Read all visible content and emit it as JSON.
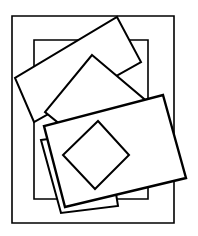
{
  "figure": {
    "canvas": {
      "width": 198,
      "height": 236
    },
    "colors": {
      "background": "#ffffff",
      "stroke": "#000000",
      "fill": "#ffffff"
    },
    "shape_count": 7,
    "shapes": [
      {
        "id": "outer-border-rectangle",
        "name": "outer-border-rectangle",
        "kind": "rectangle",
        "orientation": "axis-aligned",
        "stroke_weight": "thin",
        "z": 1,
        "points": "12,16 174,16 174,223 12,223"
      },
      {
        "id": "inner-upright-rectangle",
        "name": "inner-upright-rectangle",
        "kind": "rectangle",
        "orientation": "axis-aligned",
        "stroke_weight": "thin",
        "z": 2,
        "points": "34,40 148,40 148,199 34,199"
      },
      {
        "id": "upper-left-tilted-rectangle",
        "name": "upper-left-tilted-rectangle",
        "kind": "rectangle",
        "orientation": "rotated",
        "stroke_weight": "medium",
        "z": 3,
        "points": "117,17 141,62 34,122 15,78"
      },
      {
        "id": "lower-left-tilted-rectangle",
        "name": "lower-left-tilted-rectangle",
        "kind": "rectangle",
        "orientation": "rotated",
        "stroke_weight": "medium",
        "z": 4,
        "points": "41,140 106,131 118,206 61,213"
      },
      {
        "id": "center-large-tilted-rectangle",
        "name": "center-large-tilted-rectangle",
        "kind": "rectangle",
        "orientation": "rotated",
        "stroke_weight": "medium",
        "z": 5,
        "points": "92,55 150,104 104,160 45,112"
      },
      {
        "id": "lower-right-tilted-rectangle",
        "name": "lower-right-tilted-rectangle",
        "kind": "rectangle",
        "orientation": "rotated",
        "stroke_weight": "thick",
        "z": 6,
        "points": "163,95 186,178 65,207 44,126"
      },
      {
        "id": "center-small-diamond",
        "name": "center-small-diamond",
        "kind": "square-rotated-45",
        "orientation": "rotated",
        "stroke_weight": "medium",
        "z": 7,
        "points": "98,121 129,155 95,189 63,155"
      }
    ]
  }
}
